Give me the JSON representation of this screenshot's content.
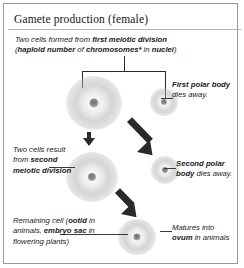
{
  "panel": {
    "title": "Gamete production (female)",
    "border_color": "#9a9a9a",
    "background": "#ffffff",
    "ink_color": "#1b1b1b"
  },
  "intro": {
    "line1_plain": "Two cells formed from ",
    "line1_bold": "first meiotic division",
    "line2_open": "(",
    "line2_bold1": "haploid number",
    "line2_mid": " of ",
    "line2_bold2": "chromosomes*",
    "line2_mid2": " in ",
    "line2_bold3": "nuclei",
    "line2_close": ")"
  },
  "labels": {
    "first_polar_body_bold": "First polar body",
    "first_polar_body_rest": " dies away.",
    "second_division_plain": "Two cells result from ",
    "second_division_bold": "second meiotic division",
    "second_polar_body_bold": "Second polar body",
    "second_polar_body_rest": " dies away.",
    "remaining_plain1": "Remaining cell (",
    "remaining_bold1": "ootid",
    "remaining_plain2": " in animals, ",
    "remaining_bold2": "embryo sac",
    "remaining_plain3": " in flowering plants)",
    "matures_plain1": "Matures into ",
    "matures_bold": "ovum",
    "matures_plain2": " in animals"
  },
  "cells": {
    "primary_oocyte": "secondary-oocyte-large-cell",
    "first_polar_body": "first-polar-body-small-cell",
    "ootid_cell": "ootid-large-cell",
    "second_polar_body": "second-polar-body-small-cell",
    "ovum_cell": "ovum-cell"
  },
  "connectors": {
    "bracket": "division-bracket",
    "arrow_down": "meiosis-arrow-down",
    "arrow_diag_1": "polar-body-arrow-1",
    "arrow_diag_2": "polar-body-arrow-2"
  }
}
